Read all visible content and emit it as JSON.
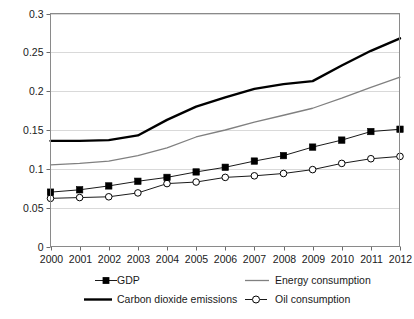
{
  "chart_data": {
    "type": "line",
    "title": "",
    "subtitle": "",
    "xlabel": "",
    "ylabel": "",
    "grid": true,
    "legend_position": "bottom",
    "x": [
      2000,
      2001,
      2002,
      2003,
      2004,
      2005,
      2006,
      2007,
      2008,
      2009,
      2010,
      2011,
      2012
    ],
    "categories": [
      "2000",
      "2001",
      "2002",
      "2003",
      "2004",
      "2005",
      "2006",
      "2007",
      "2008",
      "2009",
      "2010",
      "2011",
      "2012"
    ],
    "xlim": [
      2000,
      2012
    ],
    "ylim": [
      0,
      0.3
    ],
    "ytick_labels": [
      "0",
      "0.05",
      "0.1",
      "0.15",
      "0.2",
      "0.25",
      "0.3"
    ],
    "yticks": [
      0,
      0.05,
      0.1,
      0.15,
      0.2,
      0.25,
      0.3
    ],
    "series": [
      {
        "name": "GDP",
        "marker": "filled-square",
        "color": "#000000",
        "values": [
          0.07,
          0.073,
          0.078,
          0.084,
          0.089,
          0.096,
          0.102,
          0.11,
          0.117,
          0.128,
          0.137,
          0.148,
          0.151
        ]
      },
      {
        "name": "Carbon dioxide emissions",
        "marker": "none",
        "color": "#000000",
        "values": [
          0.136,
          0.136,
          0.137,
          0.143,
          0.163,
          0.18,
          0.192,
          0.203,
          0.209,
          0.213,
          0.233,
          0.252,
          0.268
        ]
      },
      {
        "name": "Energy consumption",
        "marker": "none",
        "color": "#808080",
        "values": [
          0.105,
          0.107,
          0.11,
          0.117,
          0.127,
          0.141,
          0.15,
          0.16,
          0.169,
          0.178,
          0.191,
          0.205,
          0.218
        ]
      },
      {
        "name": "Oil consumption",
        "marker": "open-circle",
        "color": "#000000",
        "values": [
          0.062,
          0.063,
          0.064,
          0.069,
          0.081,
          0.083,
          0.089,
          0.091,
          0.094,
          0.099,
          0.107,
          0.113,
          0.116
        ]
      }
    ]
  },
  "legend": {
    "entries": [
      {
        "label": "GDP",
        "key": "gdp",
        "swatch": "line-with-filled-square"
      },
      {
        "label": "Energy consumption",
        "key": "energy",
        "swatch": "gray-line"
      },
      {
        "label": "Carbon dioxide emissions",
        "key": "co2",
        "swatch": "thick-black-line"
      },
      {
        "label": "Oil consumption",
        "key": "oil",
        "swatch": "line-with-open-circle"
      }
    ]
  }
}
